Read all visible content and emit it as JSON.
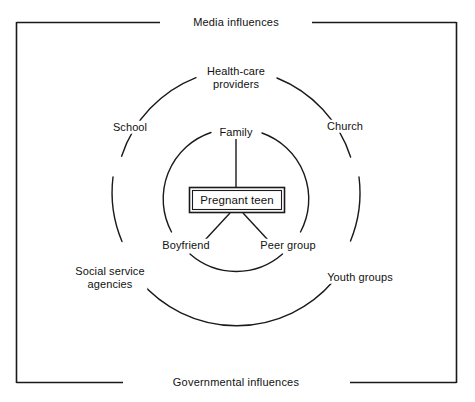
{
  "figure": {
    "type": "concentric-influence-diagram",
    "background_color": "#ffffff",
    "line_color": "#1a1a1a"
  },
  "frame": {
    "name": "outer-rectangle",
    "top_label": "Media influences",
    "bottom_label": "Governmental influences"
  },
  "core": {
    "label": "Pregnant teen",
    "shape": "double-rectangle"
  },
  "inner_ring": {
    "name": "immediate-influences",
    "items": [
      {
        "label": "Family",
        "position": "top"
      },
      {
        "label": "Boyfriend",
        "position": "bottom-left"
      },
      {
        "label": "Peer group",
        "position": "bottom-right"
      }
    ]
  },
  "outer_ring": {
    "name": "community-influences",
    "items": [
      {
        "label": "Health-care\nproviders",
        "position": "top"
      },
      {
        "label": "School",
        "position": "upper-left"
      },
      {
        "label": "Church",
        "position": "upper-right"
      },
      {
        "label": "Social service\nagencies",
        "position": "lower-left"
      },
      {
        "label": "Youth groups",
        "position": "lower-right"
      }
    ]
  },
  "connectors": {
    "family_to_core": "vertical-line",
    "boyfriend_to_core": "diagonal-line",
    "peer_group_to_core": "diagonal-line"
  }
}
